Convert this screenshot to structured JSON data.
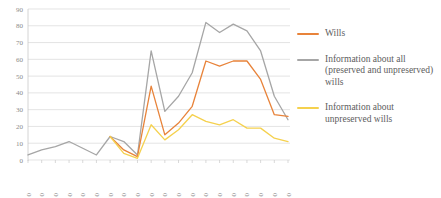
{
  "chart_data": {
    "type": "line",
    "title": "",
    "xlabel": "",
    "ylabel": "",
    "ylim": [
      0,
      90
    ],
    "ytick_step": 10,
    "grid": true,
    "legend_position": "right",
    "categories": [
      "1310",
      "1320",
      "1330",
      "1340",
      "1350",
      "1360",
      "1370",
      "1380",
      "1390",
      "1400",
      "1410",
      "1420",
      "1430",
      "1440",
      "1450",
      "1460",
      "1470",
      "1480",
      "1490",
      "1500"
    ],
    "yticks": [
      "0",
      "10",
      "20",
      "30",
      "40",
      "50",
      "60",
      "70",
      "80",
      "90"
    ],
    "series": [
      {
        "name": "Wills",
        "color": "#E8833A",
        "values": [
          null,
          null,
          null,
          null,
          null,
          null,
          14,
          6,
          2,
          44,
          15,
          22,
          32,
          59,
          56,
          59,
          59,
          48,
          27,
          26
        ]
      },
      {
        "name": "Information about all (preserved and unpreserved) wills",
        "color": "#A6A6A6",
        "values": [
          3,
          6,
          8,
          11,
          7,
          3,
          14,
          11,
          3,
          65,
          29,
          38,
          52,
          82,
          76,
          81,
          77,
          65,
          38,
          24
        ]
      },
      {
        "name": "Information about unpreserved wills",
        "color": "#F5D14E",
        "values": [
          null,
          null,
          null,
          null,
          null,
          null,
          14,
          4,
          1,
          21,
          12,
          18,
          27,
          23,
          21,
          24,
          19,
          19,
          13,
          11
        ]
      }
    ]
  },
  "legend": {
    "items": [
      {
        "label": "Wills",
        "color": "#E8833A"
      },
      {
        "label": "Information about all\n(preserved and unpreserved)\nwills",
        "color": "#A6A6A6"
      },
      {
        "label": "Information about\nunpreserved wills",
        "color": "#F5D14E"
      }
    ]
  }
}
